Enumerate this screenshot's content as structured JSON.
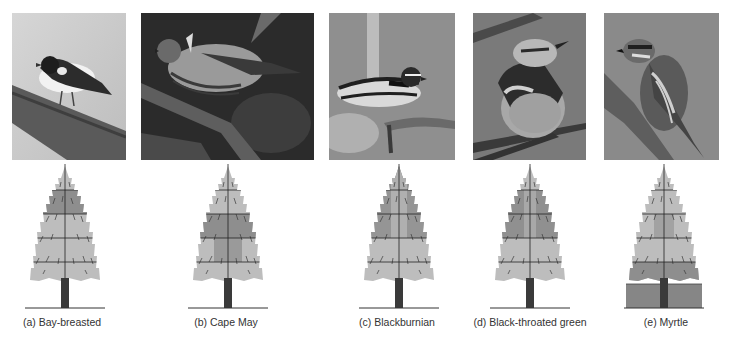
{
  "figure": {
    "panels": [
      {
        "id": "a",
        "label": "(a)  Bay-breasted",
        "bird": "Bay-breasted warbler",
        "feeding_zones": [
          2
        ]
      },
      {
        "id": "b",
        "label": "(b)  Cape May",
        "bird": "Cape May warbler",
        "feeding_zones": [
          3,
          4
        ]
      },
      {
        "id": "c",
        "label": "(c)  Blackburnian",
        "bird": "Blackburnian warbler",
        "feeding_zones": [
          1,
          2,
          3
        ]
      },
      {
        "id": "d",
        "label": "(d)  Black-throated green",
        "bird": "Black-throated green warbler",
        "feeding_zones": [
          2,
          3
        ]
      },
      {
        "id": "e",
        "label": "(e)  Myrtle",
        "bird": "Myrtle warbler",
        "feeding_zones": [
          5,
          6
        ]
      }
    ],
    "colors": {
      "light_zone": "#b9b9b9",
      "dark_zone": "#8c8c8c",
      "trunk": "#3a3a3a",
      "ground": "#858585"
    }
  }
}
